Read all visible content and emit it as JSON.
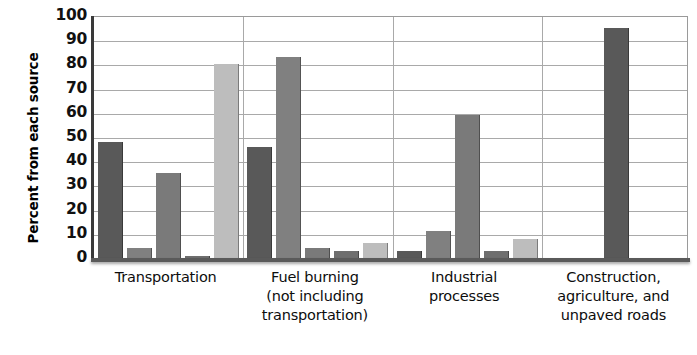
{
  "chart_data": {
    "type": "bar",
    "title": "",
    "xlabel": "",
    "ylabel": "Percent from each source",
    "ylim": [
      0,
      100
    ],
    "ytick_labels": [
      "0",
      "10",
      "20",
      "30",
      "40",
      "50",
      "60",
      "70",
      "80",
      "90",
      "100"
    ],
    "ytick_values": [
      0,
      10,
      20,
      30,
      40,
      50,
      60,
      70,
      80,
      90,
      100
    ],
    "grid": true,
    "legend": "none",
    "categories": [
      "Transportation",
      "Fuel burning (not including transportation)",
      "Industrial processes",
      "Construction, agriculture, and unpaved roads"
    ],
    "category_lines": [
      [
        "Transportation"
      ],
      [
        "Fuel burning",
        "(not including",
        "transportation)"
      ],
      [
        "Industrial",
        "processes"
      ],
      [
        "Construction,",
        "agriculture, and",
        "unpaved roads"
      ]
    ],
    "series": [
      {
        "name": "series-1",
        "color": "#595959",
        "values": [
          48,
          46,
          3,
          95
        ]
      },
      {
        "name": "series-2",
        "color": "#808080",
        "values": [
          4,
          83,
          11,
          null
        ]
      },
      {
        "name": "series-3",
        "color": "#7a7a7a",
        "values": [
          35,
          4,
          59,
          null
        ]
      },
      {
        "name": "series-4",
        "color": "#6e6e6e",
        "values": [
          1,
          3,
          3,
          null
        ]
      },
      {
        "name": "series-5",
        "color": "#bdbdbd",
        "values": [
          80,
          6,
          8,
          null
        ]
      }
    ],
    "colors": {
      "series_1": "#595959",
      "series_2": "#808080",
      "series_3": "#7a7a7a",
      "series_4": "#6e6e6e",
      "series_5": "#bdbdbd",
      "axis": "#3a3a3a",
      "grid": "#a9a9a9",
      "text": "#0d0d0d",
      "background": "#ffffff"
    }
  }
}
